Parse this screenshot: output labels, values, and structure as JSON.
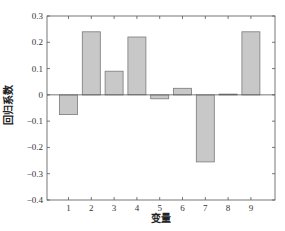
{
  "chart_data": {
    "type": "bar",
    "title": "",
    "xlabel": "变量",
    "ylabel": "回归系数",
    "categories": [
      "1",
      "2",
      "3",
      "4",
      "5",
      "6",
      "7",
      "8",
      "9"
    ],
    "values": [
      -0.075,
      0.24,
      0.09,
      0.22,
      -0.015,
      0.025,
      -0.255,
      0.003,
      0.24
    ],
    "ylim": [
      -0.4,
      0.3
    ],
    "yticks": [
      0.3,
      0.2,
      0.1,
      0,
      -0.1,
      -0.2,
      -0.3,
      -0.4
    ],
    "ytick_labels": [
      "0.3",
      "0.2",
      "0.1",
      "0",
      "−0.1",
      "−0.2",
      "−0.3",
      "−0.4"
    ],
    "grid": false,
    "legend": null,
    "bar_color": "#c8c8c8",
    "bar_edge_color": "#7a7a7a",
    "zero_line": true
  }
}
